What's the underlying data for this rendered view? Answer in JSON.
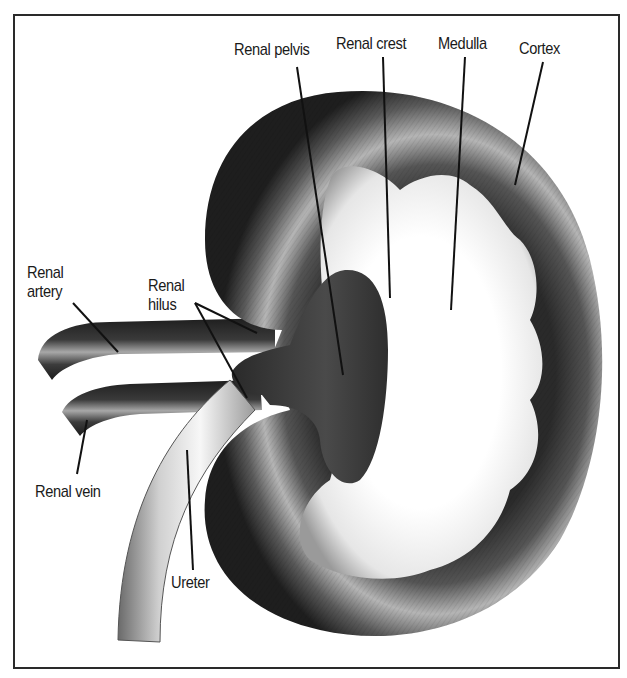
{
  "figure": {
    "colors": {
      "frame": "#2a2a2a",
      "cortex_dark": "#1c1c1c",
      "cortex_mid": "#6e6e6e",
      "cortex_light": "#c8c8c8",
      "medulla": "#ffffff",
      "pelvis": "#3a3a3a",
      "ureter_light": "#f2f2f2",
      "ureter_shadow": "#8a8a8a",
      "leader_line": "#111111"
    }
  },
  "labels": {
    "renal_pelvis": "Renal pelvis",
    "renal_crest": "Renal crest",
    "medulla": "Medulla",
    "cortex": "Cortex",
    "renal_artery_line1": "Renal",
    "renal_artery_line2": "artery",
    "renal_hilus_line1": "Renal",
    "renal_hilus_line2": "hilus",
    "renal_vein": "Renal vein",
    "ureter": "Ureter"
  }
}
